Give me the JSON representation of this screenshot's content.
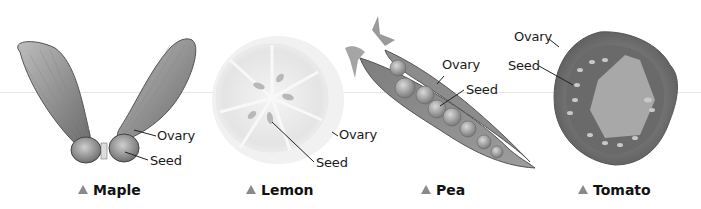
{
  "figure": {
    "specimens": [
      {
        "id": "maple",
        "caption": "Maple",
        "labels": {
          "ovary": "Ovary",
          "seed": "Seed"
        }
      },
      {
        "id": "lemon",
        "caption": "Lemon",
        "labels": {
          "ovary": "Ovary",
          "seed": "Seed"
        }
      },
      {
        "id": "pea",
        "caption": "Pea",
        "labels": {
          "ovary": "Ovary",
          "seed": "Seed"
        }
      },
      {
        "id": "tomato",
        "caption": "Tomato",
        "labels": {
          "ovary": "Ovary",
          "seed": "Seed"
        }
      }
    ],
    "caption_marker_icon": "triangle-up-icon",
    "colors": {
      "background": "#ffffff",
      "label_text": "#1a1a1a",
      "marker": "#8a8a8a",
      "leader_line": "#222222"
    }
  }
}
